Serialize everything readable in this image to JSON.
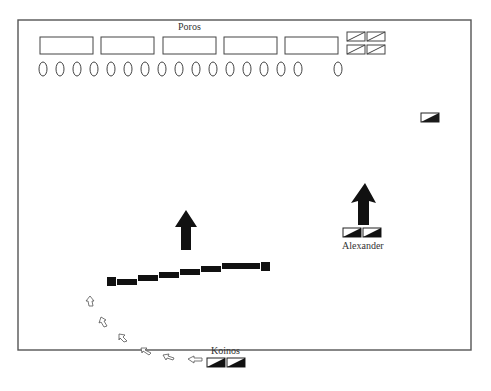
{
  "labels": {
    "poros": "Poros",
    "alexander": "Alexander",
    "koinos": "Koinos"
  },
  "colors": {
    "frame": "#555555",
    "unit_fill": "#1a1a1a",
    "outline": "#333333",
    "background": "#ffffff"
  },
  "poros_army": {
    "elephant_blocks": 5,
    "infantry_ovals": 17,
    "cavalry_units": 4
  },
  "macedonian_line_blocks": 9,
  "koinos_path_arrows": 6
}
